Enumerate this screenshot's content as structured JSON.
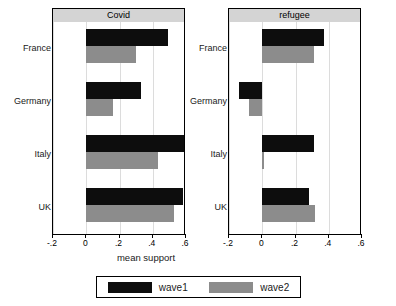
{
  "chart_data": {
    "type": "bar",
    "title": "",
    "orientation": "horizontal",
    "xlabel": "mean support",
    "ylabel": "",
    "xlim": [
      -0.2,
      0.6
    ],
    "xticks": [
      -0.2,
      0,
      0.2,
      0.4,
      0.6
    ],
    "xticklabels": [
      "-.2",
      "0",
      ".2",
      ".4",
      ".6"
    ],
    "grid": true,
    "grid_axis": "x",
    "legend_position": "bottom",
    "categories": [
      "France",
      "Germany",
      "Italy",
      "UK"
    ],
    "series": [
      {
        "name": "wave1",
        "color": "#0d0d0d"
      },
      {
        "name": "wave2",
        "color": "#8c8c8c"
      }
    ],
    "panels": [
      {
        "title": "Covid",
        "categories": [
          "France",
          "Germany",
          "Italy",
          "UK"
        ],
        "series": [
          {
            "name": "wave1",
            "values": [
              0.49,
              0.33,
              0.62,
              0.58
            ]
          },
          {
            "name": "wave2",
            "values": [
              0.3,
              0.16,
              0.43,
              0.53
            ]
          }
        ]
      },
      {
        "title": "refugee",
        "categories": [
          "France",
          "Germany",
          "Italy",
          "UK"
        ],
        "series": [
          {
            "name": "wave1",
            "values": [
              0.37,
              -0.14,
              0.31,
              0.28
            ]
          },
          {
            "name": "wave2",
            "values": [
              0.31,
              -0.08,
              0.01,
              0.32
            ]
          }
        ]
      }
    ]
  },
  "legend": {
    "items": [
      {
        "label": "wave1",
        "color": "#0d0d0d"
      },
      {
        "label": "wave2",
        "color": "#8c8c8c"
      }
    ]
  },
  "axis": {
    "xlabel": "mean support",
    "ticklabels": [
      "-.2",
      "0",
      ".2",
      ".4",
      ".6"
    ]
  },
  "panel_titles": {
    "left": "Covid",
    "right": "refugee"
  },
  "colors": {
    "wave1": "#0d0d0d",
    "wave2": "#8c8c8c",
    "panel_header_bg": "#d4d4d4",
    "gridline": "#dcdcdc",
    "axis": "#000000"
  }
}
